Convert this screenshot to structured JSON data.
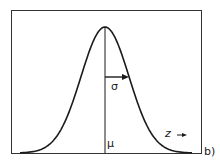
{
  "diagram": {
    "labels": {
      "sigma": "σ",
      "mu": "μ",
      "z": "z",
      "panel": "b)"
    },
    "colors": {
      "line": "#1a1a1a",
      "background": "#ffffff"
    }
  }
}
